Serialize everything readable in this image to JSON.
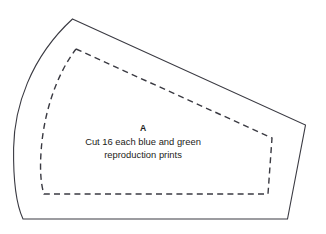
{
  "document": {
    "kind": "quilt-pattern-template",
    "background_color": "#ffffff",
    "line_color": "#3a3a42",
    "text_color": "#1c1c20",
    "width": 326,
    "height": 234
  },
  "piece": {
    "letter": "A",
    "instructions": [
      "Cut 16 each blue and green",
      "reproduction prints"
    ],
    "instruction_line_1": "Cut 16 each blue and green",
    "instruction_line_2": "reproduction prints"
  },
  "geometry": {
    "outer_cut_line": {
      "name": "cutting-line",
      "style": "solid",
      "path": "M 72.5,19 L 305.5,125 L 287.5,219 L 23,219 C 16.5,205 13.2,178 13.6,148 C 14.2,108 30,58 72.5,19 Z"
    },
    "inner_seam_line": {
      "name": "seam-line",
      "style": "dashed",
      "dash_pattern": "6 4.2",
      "path": "M 76,49 L 272,138 L 268,194 L 44,194 C 40.6,184 39.8,168 41.2,150 C 43.4,118 54,78 76,49"
    }
  },
  "labels": {
    "letter_position": {
      "x": 143,
      "y": 131
    },
    "line1_position": {
      "x": 143,
      "y": 145
    },
    "line2_position": {
      "x": 143,
      "y": 158
    }
  }
}
